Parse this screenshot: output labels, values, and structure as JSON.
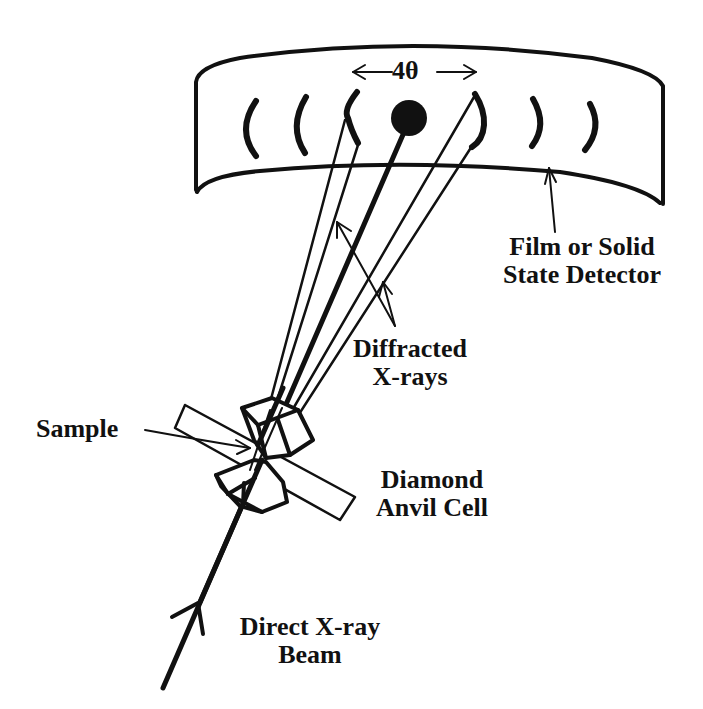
{
  "figure": {
    "background": "#ffffff",
    "ink": "#111111"
  },
  "labels": {
    "angle": "4θ",
    "detector_line1": "Film or Solid",
    "detector_line2": "State Detector",
    "diffracted_line1": "Diffracted",
    "diffracted_line2": "X-rays",
    "sample": "Sample",
    "dac_line1": "Diamond",
    "dac_line2": "Anvil Cell",
    "beam_line1": "Direct X-ray",
    "beam_line2": "Beam"
  },
  "components": {
    "detector": {
      "shape": "curved-band",
      "rings": 6,
      "central_spot": true
    },
    "diffraction_arcs": {
      "left": 3,
      "right": 3
    },
    "diffracted_cones": 2,
    "anvils": 2
  }
}
